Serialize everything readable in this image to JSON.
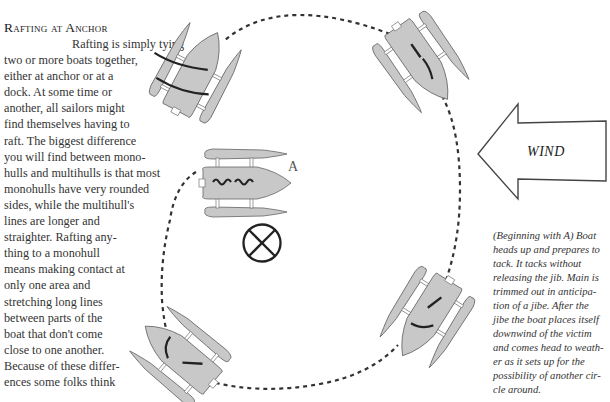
{
  "article": {
    "heading": "Rafting at Anchor",
    "lines": [
      "Rafting is simply tying",
      "two or more boats together,",
      "either at anchor or at a",
      "dock. At some time or",
      "another, all sailors might",
      "find themselves having to",
      "raft. The biggest difference",
      "you will find between mono-",
      "hulls and multihulls is that most",
      "monohulls have very rounded",
      "sides, while the multihull's",
      "lines are longer and",
      "straighter. Rafting any-",
      "thing to a monohull",
      "means making contact at",
      "only one area and",
      "stretching long lines",
      "between parts of the",
      "boat that don't come",
      "close to one another.",
      "Because of these differ-",
      "ences some folks think"
    ]
  },
  "diagram": {
    "wind_label": "WIND",
    "boat_label": "A",
    "victim_marker": "crossed-circle-icon",
    "colors": {
      "hull_fill": "#c8c8c8",
      "outline": "#666666",
      "sail": "#222222",
      "path": "#333333"
    }
  },
  "caption": {
    "lines": [
      "(Beginning with A) Boat",
      "heads up and prepares to",
      "tack.  It tacks without",
      "releasing the jib.  Main is",
      "trimmed out in anticipa-",
      "tion of a jibe.  After the",
      "jibe the boat places itself",
      "downwind of the victim",
      "and comes head to weath-",
      "er as it sets up for the",
      "possibility of another cir-",
      "cle around."
    ]
  }
}
